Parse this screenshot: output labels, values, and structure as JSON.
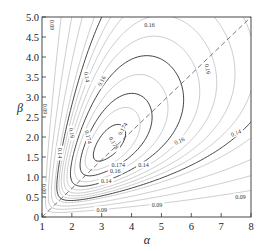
{
  "chart_data": {
    "type": "contour",
    "title": "",
    "xlabel": "α",
    "ylabel": "β",
    "xlim": [
      1,
      8
    ],
    "ylim": [
      0,
      5
    ],
    "x_ticks": [
      "1",
      "2",
      "3",
      "4",
      "5",
      "6",
      "7",
      "8"
    ],
    "y_ticks": [
      "0",
      "0.5",
      "1.0",
      "1.5",
      "2.0",
      "2.5",
      "3.0",
      "3.5",
      "4.0",
      "4.5",
      "5.0"
    ],
    "grid": false,
    "peak": {
      "alpha": 3.2,
      "beta": 1.8,
      "value": 0.178
    },
    "labeled_levels": [
      0.09,
      0.14,
      0.16,
      0.174,
      0.178
    ],
    "contour_labels": [
      {
        "text": "0.09",
        "alpha": 1.35,
        "beta": 4.8,
        "rotate": 90
      },
      {
        "text": "0.09",
        "alpha": 1.1,
        "beta": 2.7,
        "rotate": 90
      },
      {
        "text": "0.09",
        "alpha": 1.08,
        "beta": 0.7,
        "rotate": 90
      },
      {
        "text": "0.09",
        "alpha": 3.0,
        "beta": 0.18,
        "rotate": 0
      },
      {
        "text": "0.09",
        "alpha": 4.85,
        "beta": 0.3,
        "rotate": 0
      },
      {
        "text": "0.09",
        "alpha": 7.65,
        "beta": 0.5,
        "rotate": 0
      },
      {
        "text": "0.14",
        "alpha": 2.5,
        "beta": 3.5,
        "rotate": 80
      },
      {
        "text": "0.14",
        "alpha": 1.6,
        "beta": 1.6,
        "rotate": 90
      },
      {
        "text": "0.14",
        "alpha": 3.15,
        "beta": 0.9,
        "rotate": 0
      },
      {
        "text": "0.14",
        "alpha": 4.4,
        "beta": 1.3,
        "rotate": 0
      },
      {
        "text": "0.14",
        "alpha": 7.5,
        "beta": 2.1,
        "rotate": -20
      },
      {
        "text": "0.16",
        "alpha": 3.0,
        "beta": 3.4,
        "rotate": -60
      },
      {
        "text": "0.16",
        "alpha": 4.6,
        "beta": 4.8,
        "rotate": 0
      },
      {
        "text": "0.16",
        "alpha": 6.55,
        "beta": 3.7,
        "rotate": 80
      },
      {
        "text": "0.16",
        "alpha": 2.0,
        "beta": 2.1,
        "rotate": 80
      },
      {
        "text": "0.16",
        "alpha": 3.45,
        "beta": 1.15,
        "rotate": 0
      },
      {
        "text": "0.16",
        "alpha": 5.6,
        "beta": 1.9,
        "rotate": -25
      },
      {
        "text": "0.174",
        "alpha": 3.7,
        "beta": 2.2,
        "rotate": -60
      },
      {
        "text": "0.174",
        "alpha": 2.55,
        "beta": 2.0,
        "rotate": 75
      },
      {
        "text": "0.174",
        "alpha": 3.55,
        "beta": 1.3,
        "rotate": 0
      },
      {
        "text": "0.178",
        "alpha": 3.4,
        "beta": 1.85,
        "rotate": 60
      }
    ],
    "reference_line": {
      "style": "dashed",
      "from": [
        1,
        0
      ],
      "to": [
        8,
        5
      ]
    }
  }
}
